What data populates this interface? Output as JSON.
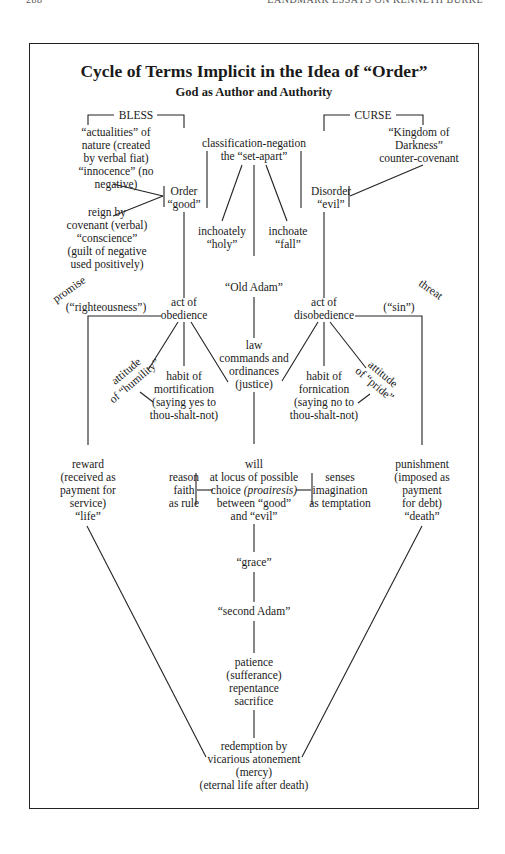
{
  "running_header": {
    "page_number": "288",
    "book_title": "LANDMARK ESSAYS ON KENNETH BURKE"
  },
  "diagram": {
    "title": "Cycle of Terms Implicit in the Idea of “Order”",
    "subtitle": "God as Author and Authority",
    "bless": "BLESS",
    "curse": "CURSE",
    "left_top": [
      "“actualities” of",
      "nature (created",
      "by verbal fiat)",
      "“innocence” (no",
      "negative)"
    ],
    "left_bottom": [
      "reign by",
      "covenant (verbal)",
      "“conscience”",
      "(guilt of negative",
      "used positively)"
    ],
    "order": [
      "Order",
      "“good”"
    ],
    "classification": [
      "classification-negation",
      "the “set-apart”"
    ],
    "disorder": [
      "Disorder",
      "“evil”"
    ],
    "kingdom": [
      "“Kingdom of",
      "Darkness”",
      "counter-covenant"
    ],
    "inchoately_holy": [
      "inchoately",
      "“holy”"
    ],
    "inchoate_fall": [
      "inchoate",
      "“fall”"
    ],
    "old_adam": "“Old Adam”",
    "promise": "promise",
    "threat": "threat",
    "righteousness": "(“righteousness”)",
    "sin": "(“sin”)",
    "obedience": [
      "act of",
      "obedience"
    ],
    "disobedience": [
      "act of",
      "disobedience"
    ],
    "law": [
      "law",
      "commands and",
      "ordinances",
      "(justice)"
    ],
    "humility": [
      "attitude",
      "of “humility”"
    ],
    "mortification": [
      "habit of",
      "mortification",
      "(saying yes to",
      "thou-shalt-not)"
    ],
    "fornication": [
      "habit of",
      "fornication",
      "(saying no to",
      "thou-shalt-not)"
    ],
    "pride": [
      "attitude",
      "of “pride”"
    ],
    "reward": [
      "reward",
      "(received as",
      "payment for",
      "service)",
      "“life”"
    ],
    "reason": [
      "reason",
      "faith",
      "as rule"
    ],
    "will": [
      "will",
      "at locus of possible",
      "choice ",
      "(proairesis)",
      "between “good”",
      "and “evil”"
    ],
    "senses": [
      "senses",
      "imagination",
      "as temptation"
    ],
    "punishment": [
      "punishment",
      "(imposed as",
      "payment",
      "for debt)",
      "“death”"
    ],
    "grace": "“grace”",
    "second_adam": "“second Adam”",
    "patience": [
      "patience",
      "(sufferance)",
      "repentance",
      "sacrifice"
    ],
    "redemption": [
      "redemption by",
      "vicarious atonement",
      "(mercy)",
      "(eternal life after death)"
    ]
  }
}
